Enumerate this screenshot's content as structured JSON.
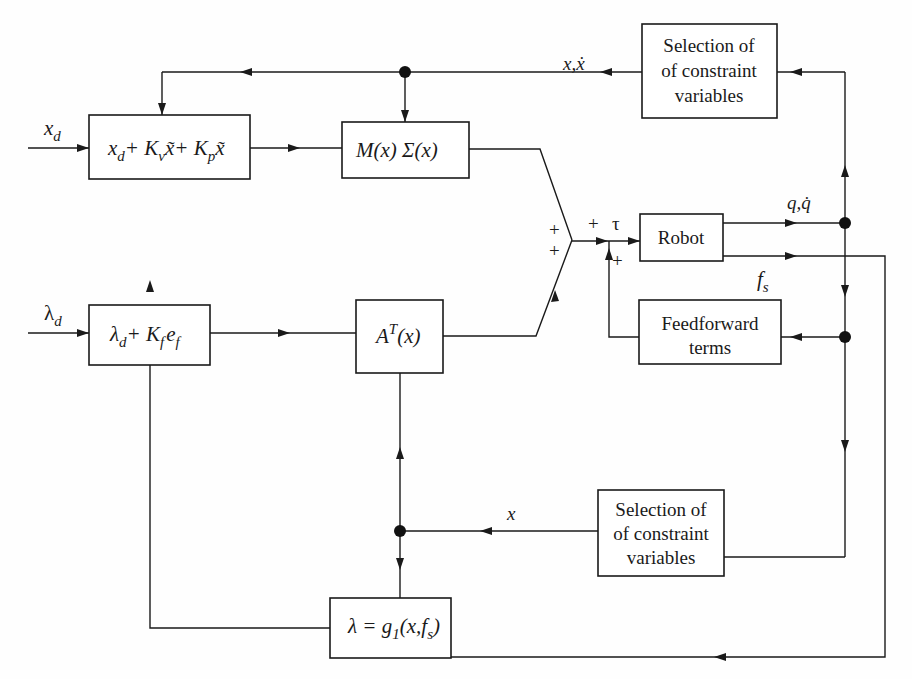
{
  "diagram": {
    "type": "block-diagram",
    "blocks": {
      "position_law": {
        "label": "x_d + K_v x̃̇ + K_p x̃",
        "parts": [
          "x",
          "d",
          "+ K",
          "v",
          "x̃",
          "+ K",
          "p",
          "x̃"
        ]
      },
      "mass_block": {
        "label": "M(x) Σ(x)"
      },
      "force_law": {
        "label": "λ_d + K_f e_f",
        "parts": [
          "λ",
          "d",
          "+ K",
          "f",
          "e",
          "f"
        ]
      },
      "jacobian_block": {
        "label": "A^T(x)",
        "parts": [
          "A",
          "T",
          "(x)"
        ]
      },
      "robot": {
        "label": "Robot"
      },
      "selection_top": {
        "lines": [
          "Selection of",
          "of constraint",
          "variables"
        ]
      },
      "feedforward": {
        "lines": [
          "Feedforward",
          "terms"
        ]
      },
      "selection_bottom": {
        "lines": [
          "Selection of",
          "of constraint",
          "variables"
        ]
      },
      "lambda_block": {
        "label": "λ = g_1(x, f_s)",
        "parts": [
          "λ = g",
          "1",
          "(x,f",
          "s",
          ")"
        ]
      }
    },
    "signals": {
      "x_d": {
        "main": "x",
        "sub": "d"
      },
      "lambda_d": {
        "main": "λ",
        "sub": "d"
      },
      "x_xdot": "x,ẋ",
      "q_qdot": "q,q̇",
      "f_s": {
        "main": "f",
        "sub": "s"
      },
      "tau": "τ",
      "x_sel": "x"
    },
    "summing_signs": {
      "upper": "+",
      "lower": "+",
      "junction_top": "+",
      "junction_bottom": "+"
    }
  }
}
